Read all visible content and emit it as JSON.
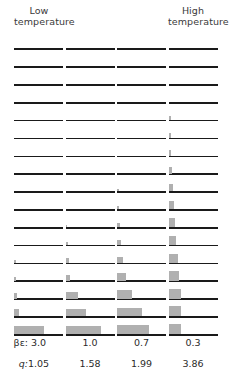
{
  "header": {
    "low_label": "Low\ntemperature",
    "low_line1": "Low",
    "low_line2": "temperature",
    "high_line1": "High",
    "high_line2": "temperature"
  },
  "footer": {
    "beta_label": "βε:",
    "q_label": "q:",
    "beta_values": [
      "3.0",
      "1.0",
      "0.7",
      "0.3"
    ],
    "q_values": [
      "1.05",
      "1.58",
      "1.99",
      "3.86"
    ]
  },
  "colors": {
    "baseline": "#1a1a1a",
    "bar": "#b0b0b0",
    "text": "#333333",
    "background": "#ffffff"
  },
  "chart_data": {
    "type": "bar",
    "title": "",
    "subtitle": "",
    "xlabel": "",
    "ylabel": "",
    "grid": false,
    "legend": "none",
    "columns": [
      {
        "name": "col-1",
        "beta_epsilon": 3.0,
        "q": 1.05
      },
      {
        "name": "col-2",
        "beta_epsilon": 1.0,
        "q": 1.58
      },
      {
        "name": "col-3",
        "beta_epsilon": 0.7,
        "q": 1.99
      },
      {
        "name": "col-4",
        "beta_epsilon": 0.3,
        "q": 3.86
      }
    ],
    "rows": [
      1,
      2,
      3,
      4,
      5,
      6,
      7,
      8,
      9,
      10,
      11,
      12,
      13,
      14,
      15,
      16,
      17
    ],
    "xlim": [
      0,
      1
    ],
    "ylim": [
      0,
      1
    ],
    "series": [
      {
        "name": "beta*epsilon = 3.0",
        "bar_widths": [
          0,
          0,
          0,
          0,
          0,
          0,
          0,
          0,
          0,
          0,
          0,
          0,
          0.04,
          0.05,
          0.07,
          0.1,
          0.62
        ],
        "bar_heights": [
          0,
          0,
          0,
          0,
          0,
          0,
          0,
          0,
          0,
          0,
          0,
          0,
          0.18,
          0.26,
          0.34,
          0.48,
          0.55
        ]
      },
      {
        "name": "beta*epsilon = 1.0",
        "bar_widths": [
          0,
          0,
          0,
          0,
          0,
          0,
          0,
          0,
          0,
          0,
          0.04,
          0.05,
          0.07,
          0.1,
          0.26,
          0.42,
          0.72
        ],
        "bar_heights": [
          0,
          0,
          0,
          0,
          0,
          0,
          0,
          0,
          0,
          0,
          0.16,
          0.22,
          0.3,
          0.4,
          0.46,
          0.52,
          0.58
        ]
      },
      {
        "name": "beta*epsilon = 0.7",
        "bar_widths": [
          0,
          0,
          0,
          0,
          0,
          0,
          0,
          0,
          0.04,
          0.05,
          0.06,
          0.08,
          0.12,
          0.18,
          0.3,
          0.5,
          0.66
        ],
        "bar_heights": [
          0,
          0,
          0,
          0,
          0,
          0,
          0,
          0,
          0.14,
          0.2,
          0.26,
          0.34,
          0.42,
          0.5,
          0.54,
          0.58,
          0.6
        ]
      },
      {
        "name": "beta*epsilon = 0.3",
        "bar_widths": [
          0,
          0,
          0,
          0,
          0.05,
          0.05,
          0.06,
          0.07,
          0.09,
          0.11,
          0.13,
          0.16,
          0.19,
          0.22,
          0.25,
          0.26,
          0.26
        ],
        "bar_heights": [
          0,
          0,
          0,
          0,
          0.3,
          0.34,
          0.4,
          0.46,
          0.5,
          0.55,
          0.58,
          0.6,
          0.62,
          0.64,
          0.66,
          0.68,
          0.7
        ]
      }
    ]
  },
  "layout": {
    "panel_left": [
      14,
      65.5,
      117,
      168.5
    ],
    "panel_width": 49,
    "row_top_first": 35,
    "row_step": 17.85,
    "panel_height": 15
  }
}
